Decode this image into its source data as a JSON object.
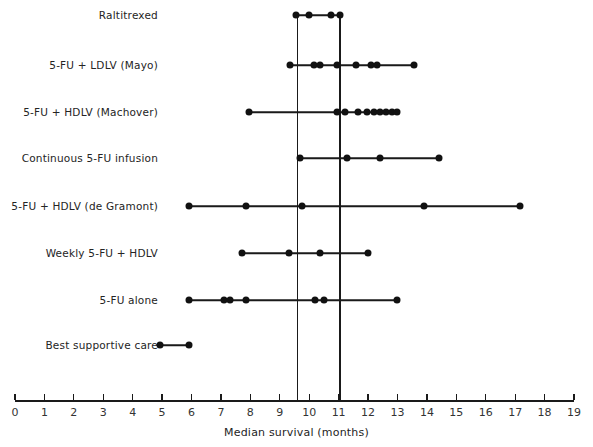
{
  "chart_data": {
    "type": "scatter",
    "title": "",
    "xlabel": "Median survival (months)",
    "ylabel": "",
    "xlim": [
      0,
      19
    ],
    "xticks": [
      0,
      1,
      2,
      3,
      4,
      5,
      6,
      7,
      8,
      9,
      10,
      11,
      12,
      13,
      14,
      15,
      16,
      17,
      18,
      19
    ],
    "xtick_labels": [
      "0",
      "1",
      "2",
      "3",
      "4",
      "5",
      "6",
      "7",
      "8",
      "9",
      "10",
      "11",
      "12",
      "13",
      "14",
      "15",
      "16",
      "17",
      "18",
      "19"
    ],
    "grid": false,
    "legend": "none",
    "reference_lines": [
      9.6,
      11.05
    ],
    "categories": [
      "Raltitrexed",
      "5-FU + LDLV (Mayo)",
      "5-FU + HDLV (Machover)",
      "Continuous 5-FU infusion",
      "5-FU + HDLV (de Gramont)",
      "Weekly 5-FU + HDLV",
      "5-FU alone",
      "Best supportive care"
    ],
    "rows": [
      {
        "label": "Raltitrexed",
        "values": [
          9.55,
          10.0,
          10.75,
          11.05
        ],
        "range": [
          9.55,
          11.05
        ]
      },
      {
        "label": "5-FU + LDLV (Mayo)",
        "values": [
          9.35,
          10.15,
          10.35,
          10.95,
          11.6,
          12.1,
          12.3,
          13.55
        ],
        "range": [
          9.35,
          13.55
        ]
      },
      {
        "label": "5-FU + HDLV (Machover)",
        "values": [
          7.95,
          10.95,
          11.2,
          11.65,
          11.95,
          12.2,
          12.4,
          12.6,
          12.8,
          13.0
        ],
        "range": [
          7.95,
          13.0
        ]
      },
      {
        "label": "Continuous 5-FU infusion",
        "values": [
          9.7,
          11.3,
          12.4,
          14.4
        ],
        "range": [
          9.7,
          14.4
        ]
      },
      {
        "label": "5-FU + HDLV (de Gramont)",
        "values": [
          5.9,
          7.85,
          9.75,
          13.9,
          17.15
        ],
        "range": [
          5.9,
          17.15
        ]
      },
      {
        "label": "Weekly 5-FU + HDLV",
        "values": [
          7.7,
          9.3,
          10.35,
          12.0
        ],
        "range": [
          7.7,
          12.0
        ]
      },
      {
        "label": "5-FU alone",
        "values": [
          5.9,
          7.1,
          7.3,
          7.85,
          10.2,
          10.5,
          13.0
        ],
        "range": [
          5.9,
          13.0
        ]
      },
      {
        "label": "Best supportive care",
        "values": [
          4.93,
          5.9
        ],
        "range": [
          4.93,
          5.9
        ]
      }
    ]
  },
  "style": {
    "marker_color": "#111111",
    "line_color": "#1a1a1a",
    "axis_color": "#1a1a1a",
    "text_color": "#242424",
    "background": "#ffffff"
  }
}
